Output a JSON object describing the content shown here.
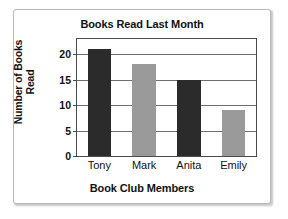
{
  "chart_data": {
    "type": "bar",
    "title": "Books Read Last Month",
    "xlabel": "Book Club Members",
    "ylabel": "Number of Books Read",
    "categories": [
      "Tony",
      "Mark",
      "Anita",
      "Emily"
    ],
    "values": [
      21,
      18,
      15,
      9
    ],
    "bar_colors": [
      "#2b2b2b",
      "#9a9a9a",
      "#2b2b2b",
      "#9a9a9a"
    ],
    "ylim": [
      0,
      23
    ],
    "yticks": [
      0,
      5,
      10,
      15,
      20
    ],
    "ytick_labels": [
      "0",
      "5",
      "10",
      "15",
      "20"
    ],
    "grid": true,
    "grid_axis": "y",
    "legend": false
  },
  "style": {
    "plot_border_color": "#4a4a4a",
    "gridline_color": "#6e6e6e",
    "frame_border_color": "#b9b9b9",
    "background": "#ffffff",
    "text_color": "#111111"
  }
}
